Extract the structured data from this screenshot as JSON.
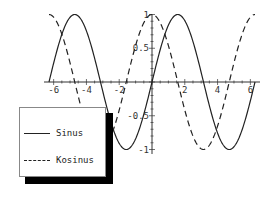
{
  "chart_data": {
    "type": "line",
    "title": "",
    "xlabel": "",
    "ylabel": "",
    "xlim": [
      -6.2832,
      6.2832
    ],
    "ylim": [
      -1,
      1
    ],
    "grid": false,
    "legend_position": "bottom-left",
    "x_ticks": [
      -6,
      -4,
      -2,
      2,
      4,
      6
    ],
    "y_ticks": [
      -1,
      -0.5,
      0.5,
      1
    ],
    "x_tick_labels": [
      "-6",
      "-4",
      "-2",
      "2",
      "4",
      "6"
    ],
    "y_tick_labels": [
      "-1",
      "-0.5",
      "0.5",
      "1"
    ],
    "series": [
      {
        "name": "Sinus",
        "function": "sin(x)",
        "style": "solid",
        "color": "#222222"
      },
      {
        "name": "Kosinus",
        "function": "cos(x)",
        "style": "dashed",
        "color": "#222222"
      }
    ]
  },
  "legend": {
    "items": [
      {
        "label": "Sinus",
        "style": "solid"
      },
      {
        "label": "Kosinus",
        "style": "dashed"
      }
    ]
  }
}
